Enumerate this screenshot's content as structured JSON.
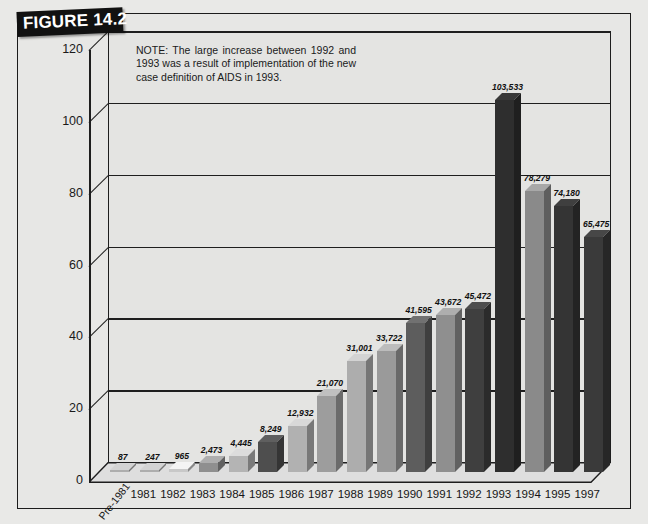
{
  "figure": {
    "banner_label": "FIGURE 14.2",
    "note": "NOTE: The large increase between 1992 and 1993 was a result of implementation of the new case definition of AIDS in 1993."
  },
  "chart_data": {
    "type": "bar",
    "title": "",
    "subtitle": "",
    "xlabel": "",
    "ylabel": "",
    "ylim": [
      0,
      120
    ],
    "yticks": [
      "0",
      "20",
      "40",
      "60",
      "80",
      "100",
      "120"
    ],
    "ytick_values": [
      0,
      20,
      40,
      60,
      80,
      100,
      120
    ],
    "grid": true,
    "legend": "none",
    "value_unit": "thousands",
    "categories": [
      "Pre-1981",
      "1981",
      "1982",
      "1983",
      "1984",
      "1985",
      "1986",
      "1987",
      "1988",
      "1989",
      "1990",
      "1991",
      "1992",
      "1993",
      "1994",
      "1995",
      "1997"
    ],
    "values": [
      87,
      247,
      965,
      2473,
      4445,
      8249,
      12932,
      21070,
      31001,
      33722,
      41595,
      43672,
      45472,
      103533,
      78279,
      74180,
      65475
    ],
    "data_labels": [
      "87",
      "247",
      "965",
      "2,473",
      "4,445",
      "8,249",
      "12,932",
      "21,070",
      "31,001",
      "33,722",
      "41,595",
      "43,672",
      "45,472",
      "103,533",
      "78,279",
      "74,180",
      "65,475"
    ],
    "bar_colors": [
      "#adadad",
      "#adadad",
      "#c8c8c8",
      "#8f8f8f",
      "#b4b4b4",
      "#4e4e4e",
      "#b1b1b1",
      "#9d9d9d",
      "#adadad",
      "#9a9a9a",
      "#5d5d5d",
      "#8f8f8f",
      "#3f3f3f",
      "#2e2e2e",
      "#8a8a8a",
      "#343434",
      "#3a3a3a"
    ]
  },
  "colors": {
    "page_background": "#e9e9e7",
    "plot_background": "#e4e4e2",
    "axis": "#1e1e1e",
    "banner_background": "#111111",
    "banner_text": "#ffffff",
    "text": "#1a1a1a"
  }
}
